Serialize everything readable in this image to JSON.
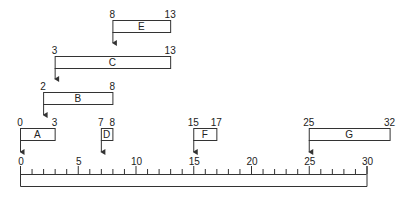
{
  "diagram": {
    "type": "timeline-intervals",
    "colors": {
      "stroke": "#333333",
      "text": "#222222",
      "background": "#ffffff"
    },
    "axis": {
      "min": 0,
      "max": 30,
      "major_ticks": [
        0,
        5,
        10,
        15,
        20,
        25,
        30
      ],
      "minor_tick_step": 1,
      "labels": [
        "0",
        "5",
        "10",
        "15",
        "20",
        "25",
        "30"
      ]
    },
    "intervals": [
      {
        "name": "E",
        "start": 8,
        "end": 13,
        "start_label": "8",
        "end_label": "13",
        "row": 0
      },
      {
        "name": "C",
        "start": 3,
        "end": 13,
        "start_label": "3",
        "end_label": "13",
        "row": 1
      },
      {
        "name": "B",
        "start": 2,
        "end": 8,
        "start_label": "2",
        "end_label": "8",
        "row": 2
      },
      {
        "name": "A",
        "start": 0,
        "end": 3,
        "start_label": "0",
        "end_label": "3",
        "row": 3
      },
      {
        "name": "D",
        "start": 7,
        "end": 8,
        "start_label": "7",
        "end_label": "8",
        "row": 3
      },
      {
        "name": "F",
        "start": 15,
        "end": 17,
        "start_label": "15",
        "end_label": "17",
        "row": 3
      },
      {
        "name": "G",
        "start": 25,
        "end": 32,
        "start_label": "25",
        "end_label": "32",
        "row": 3
      }
    ]
  }
}
